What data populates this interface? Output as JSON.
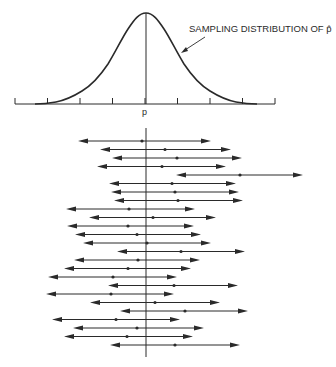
{
  "chart_data": {
    "type": "diagram",
    "title": "",
    "top_panel": {
      "curve": "normal density (bell curve)",
      "annotation": "SAMPLING DISTRIBUTION OF p̂",
      "x_center_label": "p",
      "tick_count": 9,
      "center_tick_index": 4
    },
    "bottom_panel": {
      "description": "25 confidence intervals (horizontal double-headed arrows) with point estimates; vertical line at true p",
      "intervals": [
        {
          "left": 78,
          "point": 142,
          "right": 211
        },
        {
          "left": 100,
          "point": 165,
          "right": 231
        },
        {
          "left": 112,
          "point": 177,
          "right": 242
        },
        {
          "left": 97,
          "point": 162,
          "right": 226
        },
        {
          "left": 176,
          "point": 240,
          "right": 303
        },
        {
          "left": 109,
          "point": 172,
          "right": 236
        },
        {
          "left": 111,
          "point": 175,
          "right": 239
        },
        {
          "left": 114,
          "point": 178,
          "right": 243
        },
        {
          "left": 66,
          "point": 129,
          "right": 195
        },
        {
          "left": 89,
          "point": 153,
          "right": 216
        },
        {
          "left": 67,
          "point": 128,
          "right": 194
        },
        {
          "left": 75,
          "point": 137,
          "right": 201
        },
        {
          "left": 83,
          "point": 147,
          "right": 211
        },
        {
          "left": 117,
          "point": 181,
          "right": 245
        },
        {
          "left": 74,
          "point": 138,
          "right": 200
        },
        {
          "left": 64,
          "point": 128,
          "right": 191
        },
        {
          "left": 48,
          "point": 113,
          "right": 177
        },
        {
          "left": 108,
          "point": 174,
          "right": 238
        },
        {
          "left": 46,
          "point": 111,
          "right": 174
        },
        {
          "left": 90,
          "point": 155,
          "right": 220
        },
        {
          "left": 120,
          "point": 185,
          "right": 248
        },
        {
          "left": 52,
          "point": 116,
          "right": 180
        },
        {
          "left": 73,
          "point": 137,
          "right": 204
        },
        {
          "left": 64,
          "point": 127,
          "right": 193
        },
        {
          "left": 110,
          "point": 175,
          "right": 240
        }
      ],
      "true_value_x": 146,
      "intervals_missing_p": 1
    }
  },
  "labels": {
    "annotation": "SAMPLING DISTRIBUTION OF p̂",
    "center": "p"
  },
  "colors": {
    "ink": "#2a2a2a",
    "background": "#ffffff"
  }
}
